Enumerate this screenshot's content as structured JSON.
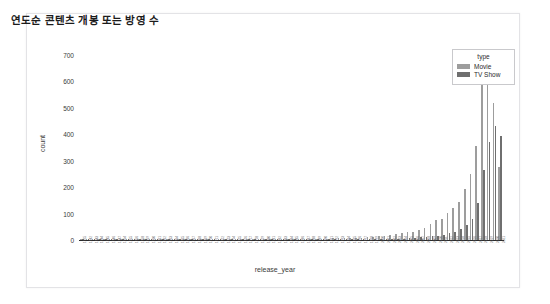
{
  "card": {
    "title": "연도순 콘텐츠 개봉 또는 방영 수"
  },
  "legend": {
    "title": "type",
    "position": "top-right",
    "entries": [
      {
        "label": "Movie",
        "color": "#9d9d9d",
        "icon": "legend-swatch-icon"
      },
      {
        "label": "TV Show",
        "color": "#6f6f6f",
        "icon": "legend-swatch-icon"
      }
    ]
  },
  "chart_data": {
    "type": "bar",
    "title": "연도순 콘텐츠 개봉 또는 방영 수",
    "xlabel": "release_year",
    "ylabel": "count",
    "ylim": [
      0,
      700
    ],
    "yticks": [
      0,
      100,
      200,
      300,
      400,
      500,
      600,
      700
    ],
    "grid": false,
    "legend_title": "type",
    "legend_position": "top-right",
    "bar_mode": "grouped",
    "categories": [
      "1925",
      "1942",
      "1943",
      "1944",
      "1945",
      "1946",
      "1947",
      "1954",
      "1955",
      "1956",
      "1958",
      "1959",
      "1960",
      "1961",
      "1962",
      "1963",
      "1964",
      "1965",
      "1966",
      "1967",
      "1968",
      "1969",
      "1970",
      "1971",
      "1972",
      "1973",
      "1974",
      "1975",
      "1976",
      "1977",
      "1978",
      "1979",
      "1980",
      "1981",
      "1982",
      "1983",
      "1984",
      "1985",
      "1986",
      "1987",
      "1988",
      "1989",
      "1990",
      "1991",
      "1992",
      "1993",
      "1994",
      "1995",
      "1996",
      "1997",
      "1998",
      "1999",
      "2000",
      "2001",
      "2002",
      "2003",
      "2004",
      "2005",
      "2006",
      "2007",
      "2008",
      "2009",
      "2010",
      "2011",
      "2012",
      "2013",
      "2014",
      "2015",
      "2016",
      "2017",
      "2018",
      "2019",
      "2020",
      "2021"
    ],
    "series": [
      {
        "name": "Movie",
        "color": "#9d9d9d",
        "values": [
          0,
          2,
          3,
          3,
          3,
          1,
          1,
          1,
          0,
          1,
          1,
          0,
          1,
          1,
          0,
          0,
          0,
          0,
          1,
          1,
          1,
          1,
          1,
          0,
          2,
          2,
          2,
          2,
          2,
          1,
          2,
          3,
          2,
          2,
          3,
          2,
          2,
          4,
          2,
          3,
          4,
          5,
          5,
          5,
          6,
          7,
          7,
          7,
          8,
          9,
          10,
          12,
          14,
          15,
          18,
          22,
          25,
          30,
          32,
          38,
          45,
          60,
          76,
          80,
          102,
          122,
          145,
          193,
          248,
          355,
          640,
          630,
          517,
          277
        ]
      },
      {
        "name": "TV Show",
        "color": "#6f6f6f",
        "values": [
          1,
          0,
          0,
          0,
          0,
          0,
          0,
          0,
          1,
          0,
          0,
          1,
          0,
          0,
          1,
          1,
          1,
          1,
          0,
          0,
          0,
          0,
          0,
          1,
          0,
          0,
          0,
          0,
          0,
          1,
          0,
          0,
          0,
          0,
          0,
          1,
          0,
          0,
          1,
          0,
          1,
          1,
          1,
          1,
          1,
          2,
          1,
          2,
          1,
          2,
          2,
          2,
          3,
          3,
          4,
          4,
          5,
          6,
          8,
          10,
          12,
          14,
          16,
          20,
          25,
          30,
          40,
          55,
          80,
          140,
          265,
          370,
          430,
          395
        ]
      }
    ]
  }
}
